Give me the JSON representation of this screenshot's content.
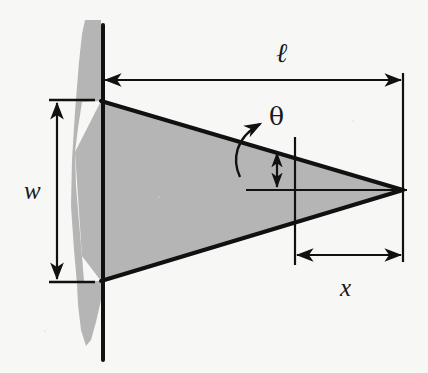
{
  "figure": {
    "width": 428,
    "height": 373,
    "background_color": "#f7f7f6",
    "shape_fill_color": "#b5b5b5",
    "line_color": "#111111"
  },
  "labels": {
    "length": "ℓ",
    "angle": "θ",
    "width": "w",
    "distance": "x"
  },
  "annotations": [
    {
      "name": "length-dimension",
      "symbol": "ℓ",
      "kind": "double-arrow-horizontal",
      "from": [
        103,
        80
      ],
      "to": [
        403,
        80
      ]
    },
    {
      "name": "width-dimension",
      "symbol": "w",
      "kind": "double-arrow-vertical",
      "from": [
        57,
        101
      ],
      "to": [
        57,
        281
      ]
    },
    {
      "name": "distance-dimension",
      "symbol": "x",
      "kind": "double-arrow-horizontal",
      "from": [
        295,
        255
      ],
      "to": [
        403,
        255
      ]
    },
    {
      "name": "angle-dimension",
      "symbol": "θ",
      "kind": "curved-arrow",
      "from": [
        240,
        176
      ],
      "to": [
        264,
        121
      ]
    },
    {
      "name": "angle-offset-dimension",
      "kind": "double-arrow-vertical",
      "from": [
        277,
        152
      ],
      "to": [
        277,
        188
      ]
    }
  ],
  "geometry": {
    "wedge_apex": [
      403,
      190
    ],
    "wedge_top_base": [
      103,
      101
    ],
    "wedge_bottom_base": [
      103,
      281
    ],
    "vertical_post_x": 103,
    "post_top_y": 25,
    "post_bottom_y": 360,
    "reference_line_x": 403,
    "inner_vertical_x": 295,
    "centerline_y": 190
  }
}
